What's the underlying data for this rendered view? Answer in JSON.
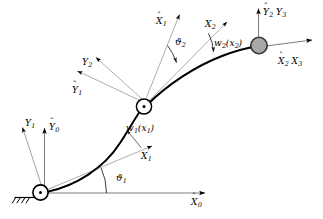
{
  "figure": {
    "background_color": "#ffffff",
    "line_color": "#000000",
    "thin_line_color": "#555555",
    "payload_fill": "#a8a8a8",
    "payload_stroke": "#1a1a1a"
  },
  "labels": {
    "y1_base": {
      "base": "Y",
      "sub": "1",
      "hat": false
    },
    "y0_hat": {
      "base": "Y",
      "sub": "0",
      "hat": true
    },
    "x0_hat": {
      "base": "X",
      "sub": "0",
      "hat": true
    },
    "theta1": {
      "base": "ϑ",
      "sub": "1"
    },
    "x1_link": {
      "base": "X",
      "sub": "1",
      "hat": false
    },
    "w1": {
      "text": "w",
      "sub": "1",
      "arg_open": "(",
      "arg": "x",
      "arg_sub": "1",
      "arg_close": ")"
    },
    "y1_hat": {
      "base": "Y",
      "sub": "1",
      "hat": true
    },
    "y2": {
      "base": "Y",
      "sub": "2",
      "hat": false
    },
    "x1_hat": {
      "base": "X",
      "sub": "1",
      "hat": true
    },
    "theta2": {
      "base": "ϑ",
      "sub": "2"
    },
    "x2": {
      "base": "X",
      "sub": "2",
      "hat": false
    },
    "w2": {
      "text": "w",
      "sub": "2",
      "arg_open": "(",
      "arg": "x",
      "arg_sub": "2",
      "arg_close": ")"
    },
    "y2_hat": {
      "base": "Y",
      "sub": "2",
      "hat": true
    },
    "y3": {
      "base": "Y",
      "sub": "3",
      "hat": false
    },
    "x2_hat": {
      "base": "X",
      "sub": "2",
      "hat": true
    },
    "x3": {
      "base": "X",
      "sub": "3",
      "hat": false
    }
  },
  "elements": {
    "base_joint": "pin-joint-base",
    "middle_joint": "revolute-joint-middle",
    "tip_payload": "payload-mass",
    "ground": "hatched-ground-support",
    "link1": "flexible-link-1-curve",
    "link2": "flexible-link-2-curve"
  }
}
